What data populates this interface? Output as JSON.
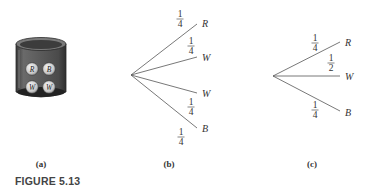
{
  "figure": {
    "caption": "FIGURE 5.13",
    "panels": [
      {
        "id": "a",
        "label": "(a)",
        "type": "urn",
        "balls": [
          "R",
          "B",
          "W",
          "W"
        ]
      },
      {
        "id": "b",
        "label": "(b)",
        "type": "tree",
        "branches": [
          {
            "outcome": "R",
            "probability": {
              "num": "1",
              "den": "4"
            }
          },
          {
            "outcome": "W",
            "probability": {
              "num": "1",
              "den": "4"
            }
          },
          {
            "outcome": "W",
            "probability": {
              "num": "1",
              "den": "4"
            }
          },
          {
            "outcome": "B",
            "probability": {
              "num": "1",
              "den": "4"
            }
          }
        ]
      },
      {
        "id": "c",
        "label": "(c)",
        "type": "tree",
        "branches": [
          {
            "outcome": "R",
            "probability": {
              "num": "1",
              "den": "4"
            }
          },
          {
            "outcome": "W",
            "probability": {
              "num": "1",
              "den": "2"
            }
          },
          {
            "outcome": "B",
            "probability": {
              "num": "1",
              "den": "4"
            }
          }
        ]
      }
    ]
  }
}
